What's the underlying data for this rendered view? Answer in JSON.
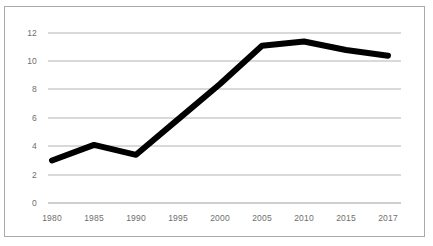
{
  "chart_data": {
    "type": "line",
    "title": "",
    "subtitle": "",
    "xlabel": "",
    "ylabel": "",
    "categories": [
      "1980",
      "1985",
      "1990",
      "1995",
      "2000",
      "2005",
      "2010",
      "2015",
      "2017"
    ],
    "x": [
      1980,
      1985,
      1990,
      1995,
      2000,
      2005,
      2010,
      2015,
      2017
    ],
    "values": [
      3.0,
      4.1,
      3.4,
      5.9,
      8.4,
      11.1,
      11.4,
      10.8,
      10.4
    ],
    "series": [
      {
        "name": "",
        "values": [
          3.0,
          4.1,
          3.4,
          5.9,
          8.4,
          11.1,
          11.4,
          10.8,
          10.4
        ]
      }
    ],
    "ylim": [
      0,
      12
    ],
    "yticks": [
      0,
      2,
      4,
      6,
      8,
      10,
      12
    ],
    "ytick_labels": [
      "0",
      "2",
      "4",
      "6",
      "8",
      "10",
      "12"
    ],
    "xtick_labels": [
      "1980",
      "1985",
      "1990",
      "1995",
      "2000",
      "2005",
      "2010",
      "2015",
      "2017"
    ],
    "grid": "horizontal",
    "legend": "none",
    "markers": "none",
    "annotations": [],
    "colors": {
      "line": "#000000",
      "gridline": "#b3b3b3",
      "axis_line": "#9d9d9d",
      "tick_text": "#6e6e6e",
      "frame_border": "#a9a9a9",
      "plot_background": "#ffffff"
    },
    "line_width": 6
  },
  "caption": {
    "text": ""
  }
}
